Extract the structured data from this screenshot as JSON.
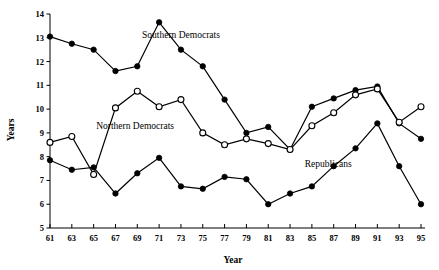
{
  "chart_data": {
    "type": "line",
    "title": "",
    "xlabel": "Year",
    "ylabel": "Years",
    "xlim": [
      61,
      95
    ],
    "ylim": [
      5,
      14
    ],
    "grid": false,
    "legend_position": "inline-annotations",
    "x": [
      61,
      63,
      65,
      67,
      69,
      71,
      73,
      75,
      77,
      79,
      81,
      83,
      85,
      87,
      89,
      91,
      93,
      95
    ],
    "xticklabels": [
      "61",
      "63",
      "65",
      "67",
      "69",
      "71",
      "73",
      "75",
      "77",
      "79",
      "81",
      "83",
      "85",
      "87",
      "89",
      "91",
      "93",
      "95"
    ],
    "yticklabels": [
      "5",
      "6",
      "7",
      "8",
      "9",
      "10",
      "11",
      "12",
      "13",
      "14"
    ],
    "yticks": [
      5,
      6,
      7,
      8,
      9,
      10,
      11,
      12,
      13,
      14
    ],
    "series": [
      {
        "name": "Southern Democrats",
        "marker": "filled-circle",
        "values": [
          13.05,
          12.75,
          12.5,
          11.6,
          11.8,
          13.65,
          12.5,
          11.8,
          10.4,
          9.0,
          9.25,
          8.3,
          10.1,
          10.45,
          10.8,
          10.95,
          9.4,
          8.75
        ]
      },
      {
        "name": "Northern Democrats",
        "marker": "open-circle",
        "values": [
          8.6,
          8.85,
          7.25,
          10.05,
          10.75,
          10.1,
          10.4,
          9.0,
          8.5,
          8.75,
          8.55,
          8.3,
          9.3,
          9.85,
          10.6,
          10.85,
          9.45,
          10.1
        ]
      },
      {
        "name": "Republicans",
        "marker": "filled-circle",
        "values": [
          7.85,
          7.45,
          7.55,
          6.45,
          7.3,
          7.95,
          6.75,
          6.65,
          7.15,
          7.05,
          6.0,
          6.45,
          6.75,
          7.6,
          8.35,
          9.4,
          7.6,
          6.0
        ]
      }
    ],
    "annotations": [
      {
        "text": "Southern Democrats",
        "x": 73.0,
        "y": 13.0
      },
      {
        "text": "Northern Democrats",
        "x": 68.8,
        "y": 9.15
      },
      {
        "text": "Republicans",
        "x": 86.5,
        "y": 7.55
      }
    ]
  }
}
